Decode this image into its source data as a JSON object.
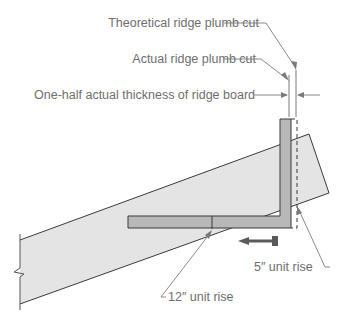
{
  "diagram": {
    "labels": {
      "theoretical_ridge_plumb_cut": "Theoretical ridge plumb cut",
      "actual_ridge_plumb_cut": "Actual ridge plumb cut",
      "half_thickness_ridge_board": "One-half actual thickness of ridge board",
      "unit_rise_5": "5″ unit rise",
      "unit_rise_12": "12″ unit rise"
    },
    "colors": {
      "rafter_fill": "#e4e4e4",
      "square_fill": "#b8b8b8",
      "outline": "#3a3a3a",
      "leader": "#7a7a7a",
      "text": "#6e6e6e",
      "arrow": "#5a5a5a"
    }
  }
}
